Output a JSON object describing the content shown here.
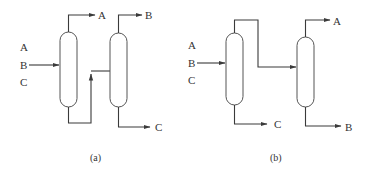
{
  "diagrams": [
    {
      "caption": "(a)",
      "feed_labels": [
        "A",
        "B",
        "C"
      ],
      "column1_top_product": "A",
      "column2_top_product": "B",
      "column2_bottom_product": "C",
      "description": "Direct sequence: column 1 removes A overhead; bottoms (B+C) fed to column 2 which splits B overhead and C bottoms"
    },
    {
      "caption": "(b)",
      "feed_labels": [
        "A",
        "B",
        "C"
      ],
      "column1_bottom_product": "C",
      "column2_top_product": "A",
      "column2_bottom_product": "B",
      "description": "Indirect sequence: column 1 removes C as bottoms; overhead (A+B) fed to column 2 which splits A overhead and B bottoms"
    }
  ],
  "colors": {
    "line": "#3a3a3a",
    "background": "#ffffff"
  }
}
